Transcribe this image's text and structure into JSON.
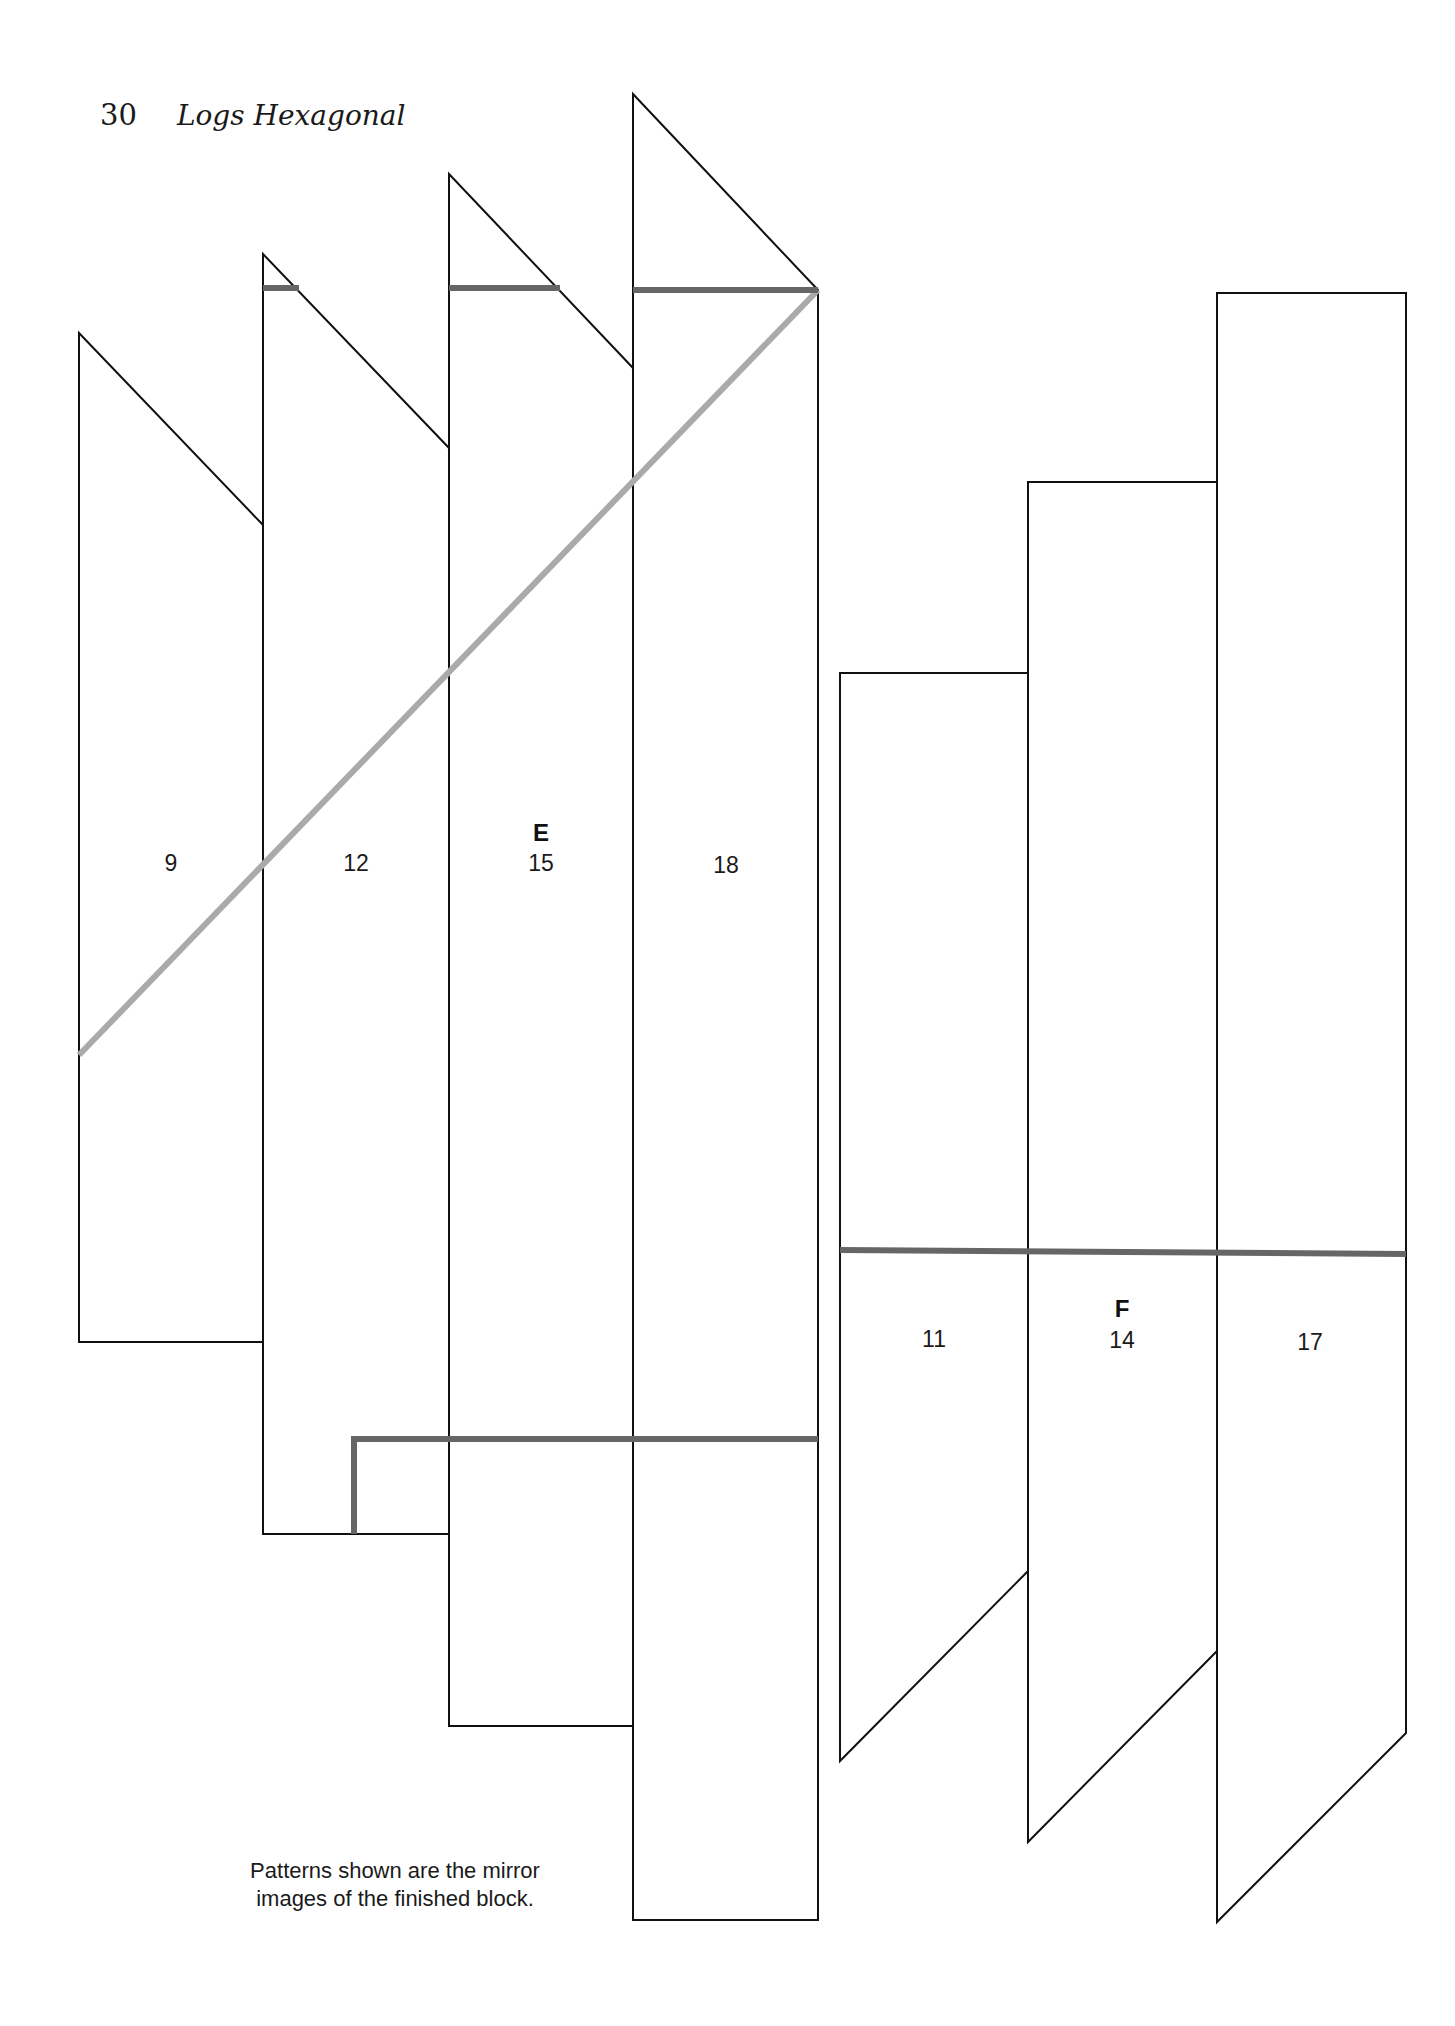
{
  "header": {
    "page_number": "30",
    "running_title": "Logs Hexagonal"
  },
  "colors": {
    "outline": "#111111",
    "seam_dark": "#666666",
    "seam_light": "#aaaaaa"
  },
  "section_labels": {
    "E": "E",
    "F": "F"
  },
  "pieces": [
    {
      "id": "9",
      "label": "9",
      "points": "79,333 263,525 263,1342 79,1342"
    },
    {
      "id": "12",
      "label": "12",
      "points": "263,254 449,448 449,1534 263,1534"
    },
    {
      "id": "15",
      "label": "15",
      "points": "449,174 633,368 633,1726 449,1726"
    },
    {
      "id": "18",
      "label": "18",
      "points": "633,94 818,290 818,1920 633,1920"
    },
    {
      "id": "11",
      "label": "11",
      "points": "840,673 1028,673 1028,1571 840,1761"
    },
    {
      "id": "14",
      "label": "14",
      "points": "1028,482 1217,482 1217,1651 1028,1842"
    },
    {
      "id": "17",
      "label": "17",
      "points": "1217,293 1406,293 1406,1733 1217,1922"
    }
  ],
  "seam_lines": {
    "top_dark_1": "263,288 299,288",
    "top_dark_2": "449,288 560,288",
    "top_dark_3": "633,290 818,290",
    "diagonal_light": "79,1055 818,290",
    "bottom_dark_L": "354,1534 354,1439 818,1439",
    "middle_dark": "840,1250 1406,1254"
  },
  "note": {
    "line1": "Patterns shown are the mirror",
    "line2": "images of the finished block."
  }
}
